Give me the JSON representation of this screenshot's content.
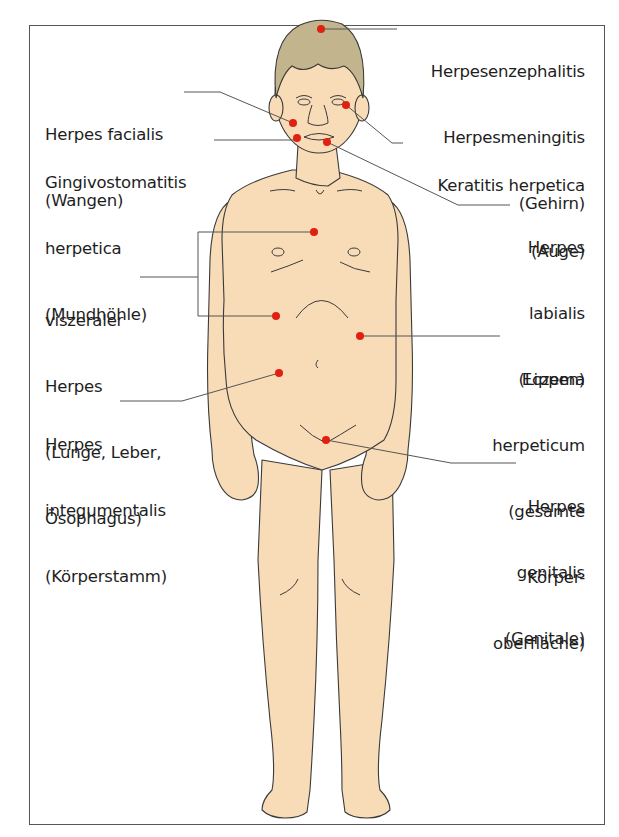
{
  "figure": {
    "type": "anatomical-diagram",
    "colors": {
      "skin": "#f8dcb8",
      "hair": "#c2b48c",
      "outline": "#3a3a3a",
      "marker": "#e02010",
      "leader_line": "#555555",
      "frame": "#555555"
    }
  },
  "labels": {
    "herpes_facialis": {
      "lines": [
        "Herpes facialis",
        "(Wangen)"
      ]
    },
    "gingivostomatitis": {
      "lines": [
        "Gingivostomatitis",
        "herpetica",
        "(Mundhöhle)"
      ]
    },
    "viszeraler": {
      "lines": [
        "viszeraler",
        "Herpes",
        "(Lunge, Leber,",
        "Ösophagus)"
      ]
    },
    "integumentalis": {
      "lines": [
        "Herpes",
        "integumentalis",
        "(Körperstamm)"
      ]
    },
    "enzephalitis": {
      "lines": [
        "Herpesenzephalitis",
        "Herpesmeningitis",
        "(Gehirn)"
      ]
    },
    "keratitis": {
      "lines": [
        "Keratitis herpetica",
        "(Auge)"
      ]
    },
    "labialis": {
      "lines": [
        "Herpes",
        "labialis",
        "(Lippen)"
      ]
    },
    "eczema": {
      "lines": [
        "Eczema",
        "herpeticum",
        "(gesamte",
        "Körper-",
        "oberfläche)"
      ]
    },
    "genitalis": {
      "lines": [
        "Herpes",
        "genitalis",
        "(Genitale)"
      ]
    }
  },
  "markers": [
    {
      "id": "brain",
      "x": 321,
      "y": 29
    },
    {
      "id": "cheek",
      "x": 293,
      "y": 123
    },
    {
      "id": "mouth",
      "x": 297,
      "y": 138
    },
    {
      "id": "eye",
      "x": 346,
      "y": 105
    },
    {
      "id": "lips",
      "x": 327,
      "y": 142
    },
    {
      "id": "chest",
      "x": 314,
      "y": 232
    },
    {
      "id": "upper-abdomen",
      "x": 276,
      "y": 316
    },
    {
      "id": "trunk-right",
      "x": 360,
      "y": 336
    },
    {
      "id": "trunk-left",
      "x": 279,
      "y": 373
    },
    {
      "id": "genital",
      "x": 326,
      "y": 440
    }
  ]
}
